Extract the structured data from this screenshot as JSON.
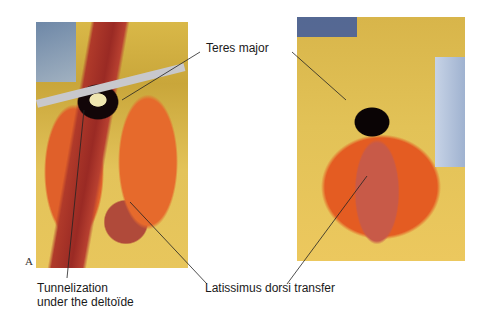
{
  "figure": {
    "panel_label": "A",
    "photos": [
      {
        "id": "left",
        "description": "Surgical photograph: latissimus dorsi tendon tunneled under deltoid"
      },
      {
        "id": "right",
        "description": "Surgical photograph: latissimus dorsi transfer completed"
      }
    ],
    "labels": {
      "teres_major": "Teres major",
      "tunnelization_line1": "Tunnelization",
      "tunnelization_line2": "under the deltoïde",
      "latissimus": "Latissimus dorsi transfer"
    },
    "colors": {
      "background": "#ffffff",
      "text": "#1a1a1a",
      "leader_line": "#222222"
    }
  }
}
